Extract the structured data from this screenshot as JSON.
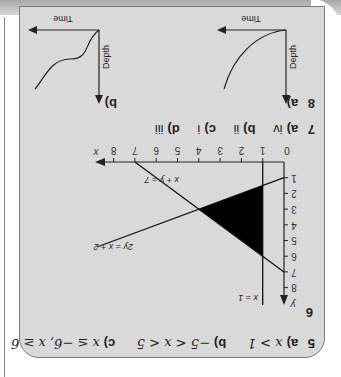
{
  "q5": {
    "number": "5",
    "parts": [
      {
        "label": "a)",
        "answer": "x > 1"
      },
      {
        "label": "b)",
        "answer": "−5 < x < 5"
      },
      {
        "label": "c)",
        "answer": "x ≤ −6, x ≥ 6"
      }
    ]
  },
  "q6": {
    "number": "6",
    "graph": {
      "x_axis_label": "x",
      "y_axis_label": "y",
      "origin_label": "0",
      "x_ticks": [
        "1",
        "2",
        "3",
        "4",
        "5",
        "6",
        "7",
        "8"
      ],
      "y_ticks": [
        "1",
        "2",
        "3",
        "4",
        "5",
        "6",
        "7",
        "8"
      ],
      "lines": [
        {
          "label": "x = 1"
        },
        {
          "label": "2y = x + 2"
        },
        {
          "label": "x + y = 7"
        }
      ],
      "shaded_region_color": "#000000"
    }
  },
  "q7": {
    "number": "7",
    "parts": [
      {
        "label": "a)",
        "answer": "iv"
      },
      {
        "label": "b)",
        "answer": "ii"
      },
      {
        "label": "c)",
        "answer": "i"
      },
      {
        "label": "d)",
        "answer": "iii"
      }
    ]
  },
  "q8": {
    "number": "8",
    "graphs": [
      {
        "label": "a)",
        "x_axis": "Time",
        "y_axis": "Depth"
      },
      {
        "label": "b)",
        "x_axis": "Time",
        "y_axis": "Depth"
      }
    ]
  },
  "colors": {
    "panel": "#d9d9d9",
    "ink": "#222222"
  }
}
